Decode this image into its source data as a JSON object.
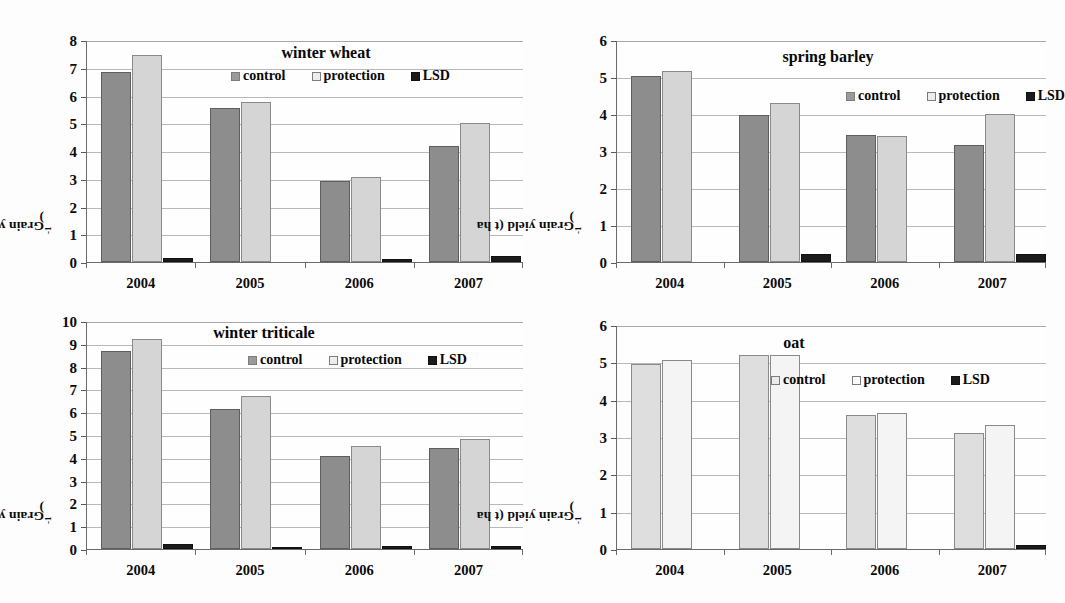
{
  "figure": {
    "background": "#fdfdfd",
    "panel_count": 4
  },
  "colors": {
    "control": "#8d8d8d",
    "protection": "#d5d5d5",
    "lsd": "#1b1b1b",
    "control_light": "#dedede",
    "protection_light": "#f4f4f4",
    "gridline": "#b9b9b9",
    "axis": "#6a6a6a",
    "text": "#080808"
  },
  "common": {
    "ylabel": "Grain yield (t ha",
    "ylabel_sup": "-1",
    "ylabel_close": ")",
    "legend": {
      "control": "control",
      "protection": "protection",
      "lsd": "LSD"
    },
    "categories": [
      "2004",
      "2005",
      "2006",
      "2007"
    ]
  },
  "chart_data": [
    {
      "type": "bar",
      "title": "winter wheat",
      "panel": "top-left",
      "xlabel": "",
      "ylabel": "Grain yield (t ha-1)",
      "categories": [
        "2004",
        "2005",
        "2006",
        "2007"
      ],
      "ylim": [
        0,
        8
      ],
      "yticks": [
        0,
        1,
        2,
        3,
        4,
        5,
        6,
        7,
        8
      ],
      "grid": true,
      "legend_position": "top-right-inside",
      "series": [
        {
          "name": "control",
          "values": [
            6.85,
            5.55,
            2.92,
            4.18
          ]
        },
        {
          "name": "protection",
          "values": [
            7.45,
            5.75,
            3.08,
            5.02
          ]
        },
        {
          "name": "LSD",
          "values": [
            0.13,
            0,
            0.1,
            0.2
          ]
        }
      ]
    },
    {
      "type": "bar",
      "title": "spring barley",
      "panel": "top-right",
      "xlabel": "",
      "ylabel": "Grain yield (t ha-1)",
      "categories": [
        "2004",
        "2005",
        "2006",
        "2007"
      ],
      "ylim": [
        0,
        6
      ],
      "yticks": [
        0,
        1,
        2,
        3,
        4,
        5,
        6
      ],
      "grid": true,
      "legend_position": "top-right-inside",
      "series": [
        {
          "name": "control",
          "values": [
            5.02,
            3.98,
            3.42,
            3.17
          ]
        },
        {
          "name": "protection",
          "values": [
            5.17,
            4.3,
            3.41,
            4.0
          ]
        },
        {
          "name": "LSD",
          "values": [
            0,
            0.21,
            0,
            0.22
          ]
        }
      ]
    },
    {
      "type": "bar",
      "title": "winter triticale",
      "panel": "bottom-left",
      "xlabel": "",
      "ylabel": "Grain yield (t ha-1)",
      "categories": [
        "2004",
        "2005",
        "2006",
        "2007"
      ],
      "ylim": [
        0,
        10
      ],
      "yticks": [
        0,
        1,
        2,
        3,
        4,
        5,
        6,
        7,
        8,
        9,
        10
      ],
      "grid": true,
      "legend_position": "top-right-inside",
      "series": [
        {
          "name": "control",
          "values": [
            8.68,
            6.12,
            4.1,
            4.45
          ]
        },
        {
          "name": "protection",
          "values": [
            9.2,
            6.7,
            4.5,
            4.82
          ]
        },
        {
          "name": "LSD",
          "values": [
            0.22,
            0.11,
            0.15,
            0.15
          ]
        }
      ]
    },
    {
      "type": "bar",
      "title": "oat",
      "panel": "bottom-right",
      "xlabel": "",
      "ylabel": "Grain yield (t ha-1)",
      "categories": [
        "2004",
        "2005",
        "2006",
        "2007"
      ],
      "ylim": [
        0,
        6
      ],
      "yticks": [
        0,
        1,
        2,
        3,
        4,
        5,
        6
      ],
      "grid": true,
      "legend_position": "top-right-inside",
      "series": [
        {
          "name": "control",
          "values": [
            4.95,
            5.2,
            3.58,
            3.1
          ]
        },
        {
          "name": "protection",
          "values": [
            5.05,
            5.2,
            3.63,
            3.32
          ]
        },
        {
          "name": "LSD",
          "values": [
            0,
            0,
            0,
            0.1
          ]
        }
      ]
    }
  ]
}
